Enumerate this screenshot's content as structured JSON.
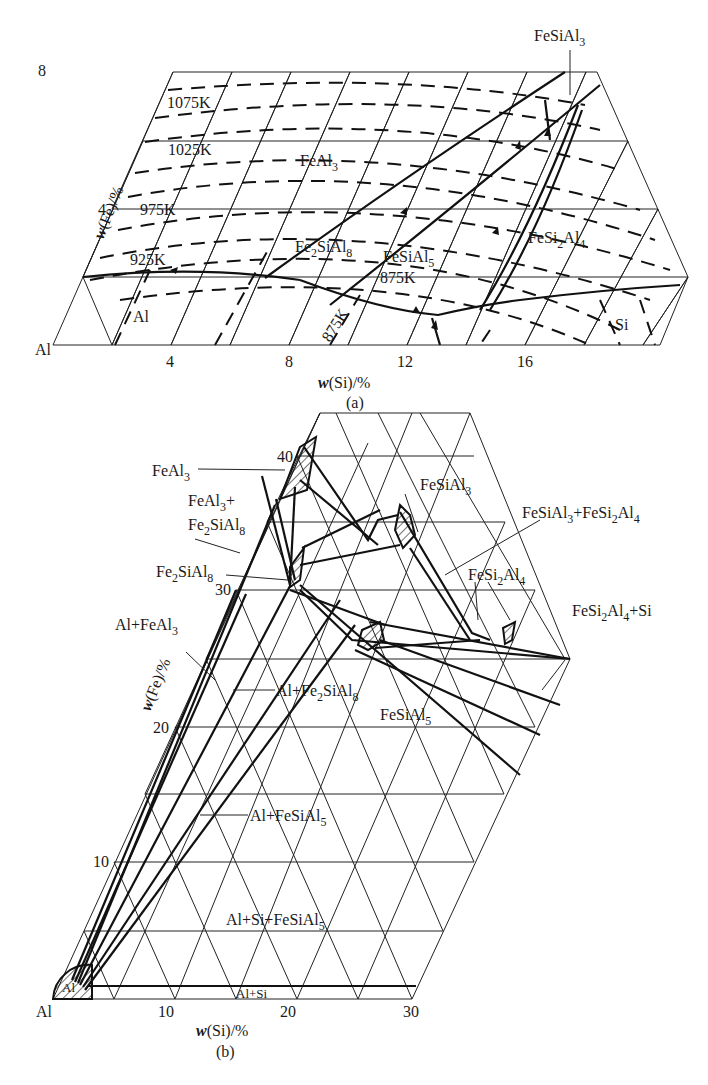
{
  "figure": {
    "panel_a": {
      "caption": "(a)",
      "x_axis": {
        "title_prefix": "w",
        "title": "(Si)/%",
        "origin_label": "Al",
        "ticks": [
          "4",
          "8",
          "12",
          "16"
        ]
      },
      "y_axis": {
        "title_prefix": "w",
        "title": "(Fe)/%",
        "ticks": [
          "4",
          "8"
        ]
      },
      "isotherms": [
        "1075K",
        "1025K",
        "975K",
        "925K",
        "875K",
        "875K"
      ],
      "phase_labels": {
        "fesial3": {
          "main": "FeSiAl",
          "sub": "3"
        },
        "feal3": {
          "main": "FeAl",
          "sub": "3"
        },
        "fe2sial8": {
          "a": "Fe",
          "b": "2",
          "c": "SiAl",
          "d": "8"
        },
        "fesial5": {
          "main": "FeSiAl",
          "sub": "5"
        },
        "fesi2al4": {
          "a": "FeSi",
          "b": "2",
          "c": "Al",
          "d": "4"
        },
        "al": "Al",
        "si": "Si"
      }
    },
    "panel_b": {
      "caption": "(b)",
      "x_axis": {
        "title_prefix": "w",
        "title": "(Si)/%",
        "origin_label": "Al",
        "ticks": [
          "10",
          "20",
          "30"
        ]
      },
      "y_axis": {
        "title_prefix": "w",
        "title": "(Fe)/%",
        "ticks": [
          "10",
          "20",
          "30",
          "40"
        ]
      },
      "phase_labels": {
        "feal3": {
          "main": "FeAl",
          "sub": "3"
        },
        "feal3_fe2sial8_line1": {
          "main": "FeAl",
          "sub": "3",
          "suffix": "+"
        },
        "feal3_fe2sial8_line2": {
          "a": "Fe",
          "b": "2",
          "c": "SiAl",
          "d": "8"
        },
        "fe2sial8": {
          "a": "Fe",
          "b": "2",
          "c": "SiAl",
          "d": "8"
        },
        "al_feal3": {
          "main": "Al+FeAl",
          "sub": "3"
        },
        "al_fe2sial8": {
          "a": "Al+Fe",
          "b": "2",
          "c": "SiAl",
          "d": "8"
        },
        "fesial5": {
          "main": "FeSiAl",
          "sub": "5"
        },
        "al_fesial5": {
          "main": "Al+FeSiAl",
          "sub": "5"
        },
        "al_si_fesial5": {
          "main": "Al+Si+FeSiAl",
          "sub": "5"
        },
        "al_si": "Al+Si",
        "al": "Al",
        "fesial3": {
          "main": "FeSiAl",
          "sub": "3"
        },
        "fesial3_fesi2al4": {
          "a": "FeSiAl",
          "b": "3",
          "c": "+FeSi",
          "d": "2",
          "e": "Al",
          "f": "4"
        },
        "fesi2al4": {
          "a": "FeSi",
          "b": "2",
          "c": "Al",
          "d": "4"
        },
        "fesi2al4_si": {
          "a": "FeSi",
          "b": "2",
          "c": "Al",
          "d": "4",
          "e": "+Si"
        }
      }
    }
  }
}
